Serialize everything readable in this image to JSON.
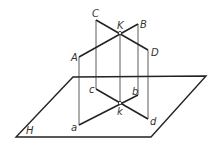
{
  "diagram": {
    "plane_label": "H",
    "points": {
      "C": {
        "label": "C",
        "x": 96,
        "y": 20
      },
      "B": {
        "label": "B",
        "x": 138,
        "y": 24
      },
      "K": {
        "label": "K",
        "x": 120,
        "y": 33
      },
      "D": {
        "label": "D",
        "x": 148,
        "y": 50
      },
      "A": {
        "label": "A",
        "x": 79,
        "y": 57
      },
      "c": {
        "label": "c",
        "x": 96,
        "y": 89
      },
      "b": {
        "label": "b",
        "x": 138,
        "y": 95
      },
      "k": {
        "label": "k",
        "x": 120,
        "y": 103
      },
      "d": {
        "label": "d",
        "x": 148,
        "y": 119
      },
      "a": {
        "label": "a",
        "x": 79,
        "y": 125
      }
    },
    "colors": {
      "line": "#222222",
      "background": "#ffffff"
    }
  }
}
